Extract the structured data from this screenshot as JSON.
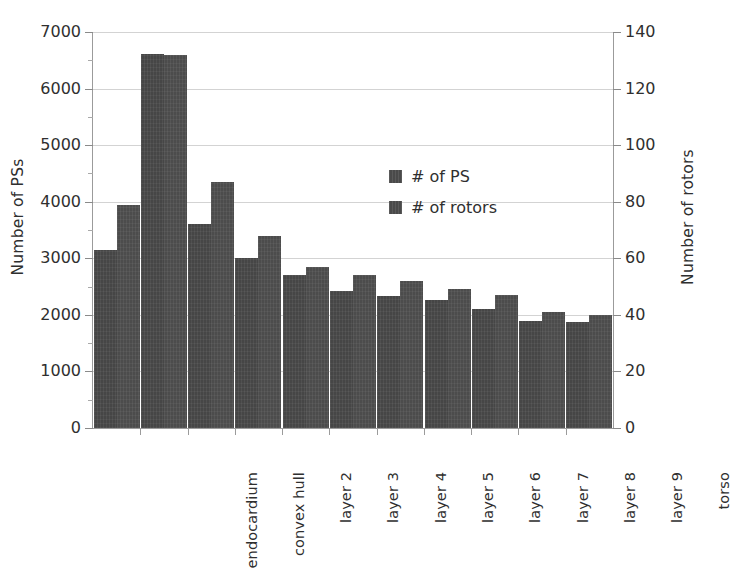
{
  "chart_data": {
    "type": "bar",
    "title": "",
    "xlabel": "",
    "ylabel": "Number of PSs",
    "y2label": "Number of rotors",
    "grid": true,
    "legend_position": "inside-center",
    "categories": [
      "endocardium",
      "convex hull",
      "layer 2",
      "layer 3",
      "layer 4",
      "layer 5",
      "layer 6",
      "layer 7",
      "layer 8",
      "layer 9",
      "torso"
    ],
    "series": [
      {
        "name": "# of PS",
        "axis": "left",
        "color": "#464646",
        "values": [
          3140,
          6620,
          3610,
          3010,
          2700,
          2430,
          2340,
          2270,
          2100,
          1890,
          1880
        ]
      },
      {
        "name": "# of rotors",
        "axis": "right",
        "color": "#4c4c4c",
        "values": [
          79,
          132,
          87,
          68,
          57,
          54,
          52,
          49,
          47,
          41,
          40
        ]
      }
    ],
    "ylim": [
      0,
      7000
    ],
    "y2lim": [
      0,
      140
    ],
    "yticks": [
      0,
      1000,
      2000,
      3000,
      4000,
      5000,
      6000,
      7000
    ],
    "y2ticks": [
      0,
      20,
      40,
      60,
      80,
      100,
      120,
      140
    ],
    "ytick_labels": [
      "0",
      "1000",
      "2000",
      "3000",
      "4000",
      "5000",
      "6000",
      "7000"
    ],
    "y2tick_labels": [
      "0",
      "20",
      "40",
      "60",
      "80",
      "100",
      "120",
      "140"
    ]
  },
  "legend": {
    "items": [
      {
        "label": "# of PS"
      },
      {
        "label": "# of rotors"
      }
    ]
  }
}
